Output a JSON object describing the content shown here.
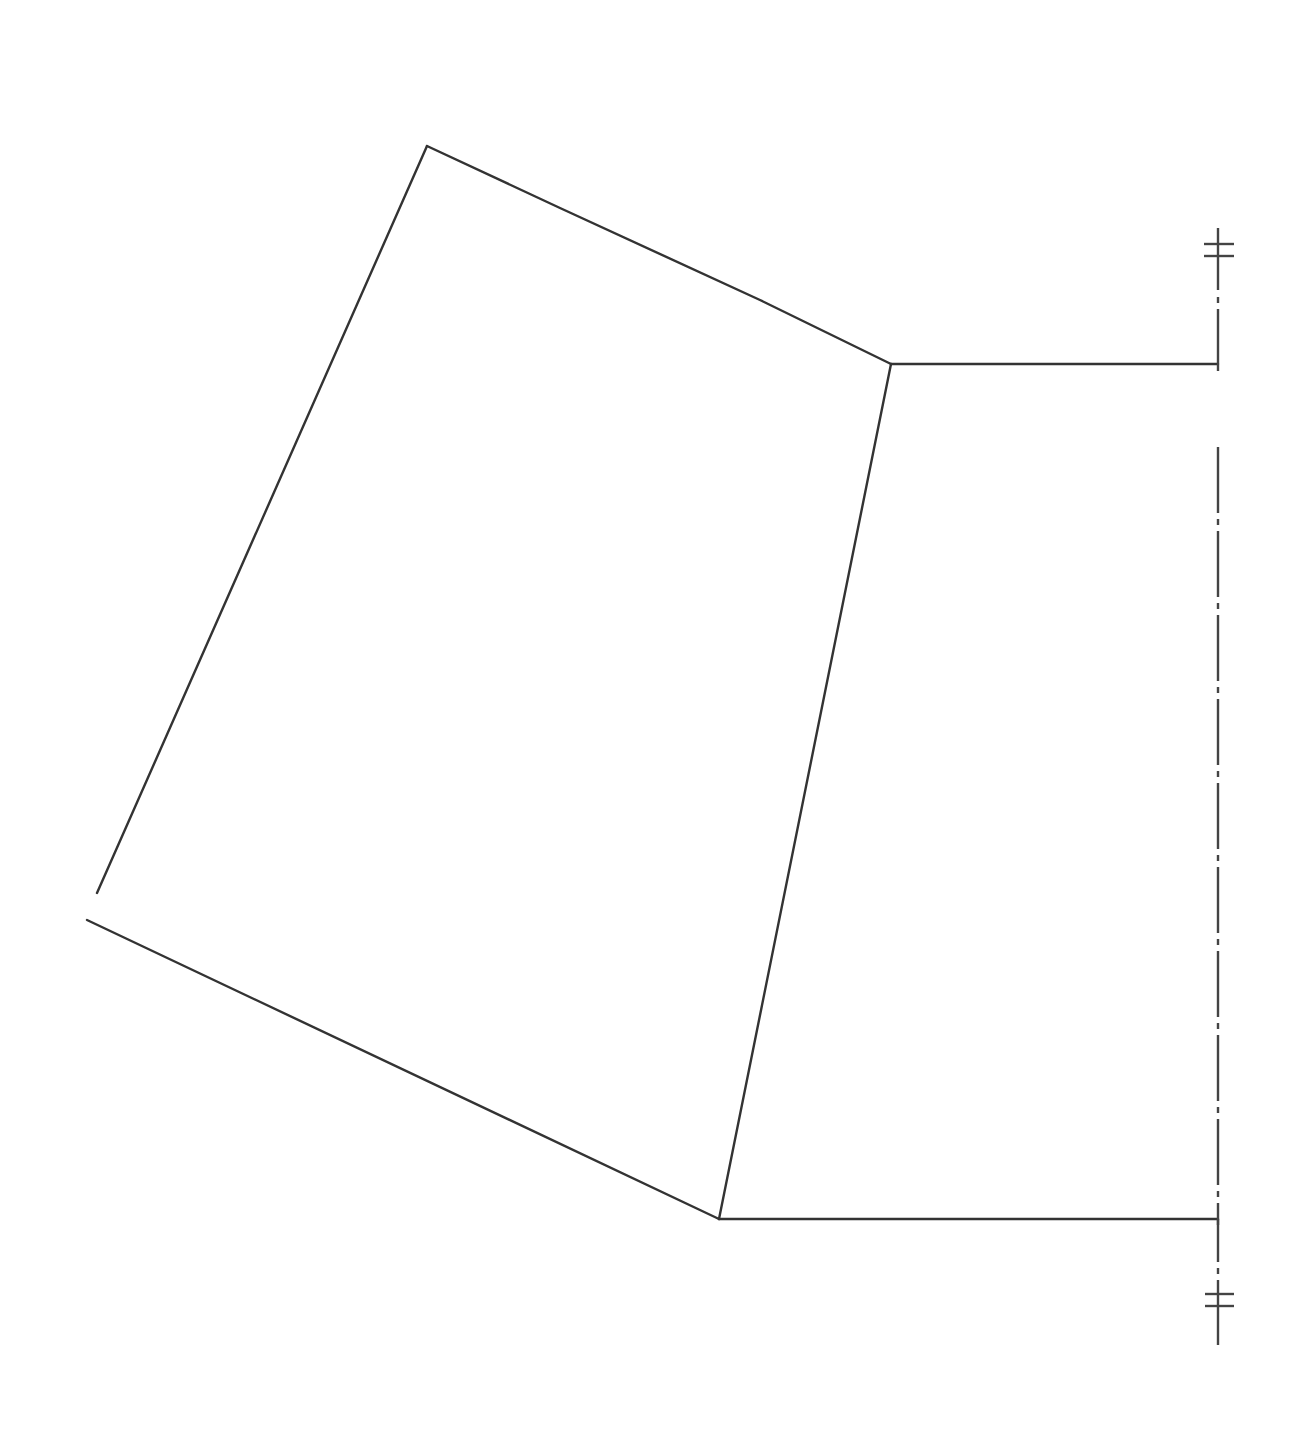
{
  "diagram": {
    "type": "technical line drawing",
    "line_color": "#333333",
    "background": "#ffffff",
    "shapes": [
      {
        "name": "outer-quadrilateral",
        "points": [
          [
            97,
            893
          ],
          [
            427,
            146
          ],
          [
            891,
            364
          ],
          [
            719,
            1219
          ],
          [
            87,
            920
          ]
        ]
      },
      {
        "name": "upper-horizontal-edge",
        "from": [
          891,
          364
        ],
        "to": [
          1218,
          364
        ]
      },
      {
        "name": "lower-horizontal-edge",
        "from": [
          719,
          1219
        ],
        "to": [
          1218,
          1219
        ]
      }
    ],
    "centerline": {
      "x": 1218,
      "y_start": 228,
      "y_end": 1345,
      "style": "dash-dot",
      "break_from": 370,
      "break_to": 448
    },
    "break_marks": [
      {
        "position": "top",
        "y": [
          244,
          256
        ]
      },
      {
        "position": "bottom",
        "y": [
          1294,
          1306
        ]
      }
    ]
  }
}
